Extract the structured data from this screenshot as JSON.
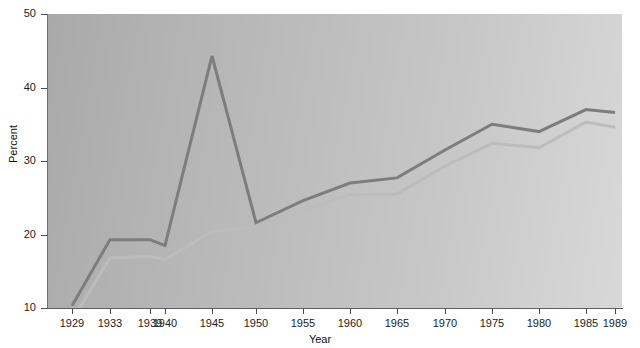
{
  "chart_data": {
    "type": "line",
    "title": "",
    "xlabel": "Year",
    "ylabel": "Percent",
    "grid": false,
    "legend_position": "none",
    "xlim": [
      1927.5,
      1991
    ],
    "ylim": [
      10,
      50
    ],
    "x": [
      1929,
      1933,
      1939,
      1940,
      1945,
      1950,
      1955,
      1960,
      1965,
      1970,
      1975,
      1980,
      1985,
      1989
    ],
    "yticks": [
      10,
      20,
      30,
      40,
      50
    ],
    "xtick_labels": [
      "1929",
      "1933",
      "1939",
      "1940",
      "1945",
      "1950",
      "1955",
      "1960",
      "1965",
      "1970",
      "1975",
      "1980",
      "1985",
      "1989"
    ],
    "series": [
      {
        "name": "upper-line",
        "color": "#7d7d7d",
        "values": [
          10.3,
          19.3,
          19.3,
          18.5,
          44.3,
          21.6,
          24.6,
          27.0,
          27.7,
          31.5,
          35.0,
          34.0,
          37.0,
          36.6
        ]
      },
      {
        "name": "lower-line",
        "color": "#bcbcbc",
        "values": [
          8.3,
          16.8,
          17.0,
          16.6,
          20.4,
          21.0,
          23.2,
          25.4,
          25.5,
          29.3,
          32.4,
          31.8,
          35.3,
          34.6
        ]
      }
    ]
  },
  "axes": {
    "y_title": "Percent",
    "x_title": "Year",
    "y_tick_labels": [
      "50",
      "40",
      "30",
      "20",
      "10"
    ]
  }
}
